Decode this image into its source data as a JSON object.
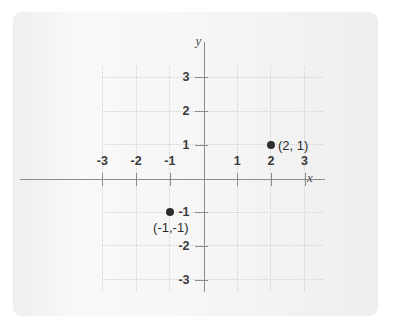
{
  "figure": {
    "kind": "cartesian-coordinate-plane",
    "card_color": "#f4f4f4",
    "background_color": "#ffffff",
    "axis_color": "#8c8c8c",
    "grid_color": "#d2d2d2",
    "point_color": "#2e2e2e"
  },
  "chart_data": {
    "type": "scatter",
    "title": "",
    "xlabel": "x",
    "ylabel": "y",
    "xlim": [
      -3.6,
      3.9
    ],
    "ylim": [
      -3.6,
      3.6
    ],
    "grid": true,
    "grid_style": "dotted",
    "legend": "none",
    "xticks": [
      -3,
      -2,
      -1,
      1,
      2,
      3
    ],
    "yticks": [
      3,
      2,
      1,
      -1,
      -2,
      -3
    ],
    "xtick_labels": [
      "-3",
      "-2",
      "-1",
      "1",
      "2",
      "3"
    ],
    "ytick_labels": [
      "3",
      "2",
      "1",
      "-1",
      "-2",
      "-3"
    ],
    "xtick_label_position": "above-axis",
    "ytick_label_position": "left-of-axis",
    "points": [
      {
        "x": 2,
        "y": 1,
        "label": "(2, 1)",
        "label_position": "right"
      },
      {
        "x": -1,
        "y": -1,
        "label": "(-1,-1)",
        "label_position": "below-left"
      }
    ]
  },
  "axes": {
    "x_name": "x",
    "y_name": "y"
  }
}
